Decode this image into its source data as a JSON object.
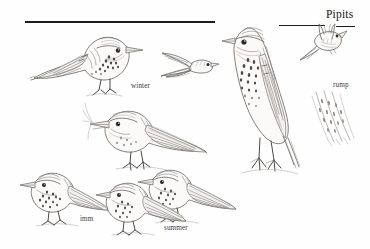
{
  "page": {
    "title": "Pipits",
    "background_color": "#fefefe",
    "ink_color": "#6f6b66",
    "rule_color": "#1c1c1c",
    "width": 370,
    "height": 249,
    "medium": "pencil-and-ink field guide plate"
  },
  "header": {
    "plate_title": "Pipits",
    "rules": [
      {
        "name": "main-rule",
        "x": 25,
        "y": 21,
        "width": 190,
        "thickness": 1.7
      },
      {
        "name": "short-rule",
        "x": 279,
        "y": 25,
        "width": 46,
        "thickness": 1.5
      },
      {
        "name": "title-underline",
        "x": 336,
        "y": 26,
        "width": 19,
        "thickness": 1.5
      }
    ]
  },
  "captions": [
    {
      "name": "winter",
      "label": "winter",
      "x": 131,
      "y": 86
    },
    {
      "name": "rump",
      "label": "rump",
      "x": 333,
      "y": 85
    },
    {
      "name": "imm",
      "label": "imm",
      "x": 80,
      "y": 219
    },
    {
      "name": "summer",
      "label": "summer",
      "x": 164,
      "y": 228
    }
  ],
  "figures": [
    {
      "name": "perched-pipit-winter",
      "kind": "perched-bird",
      "caption": "winter",
      "pose": "perched on ground, facing right",
      "x": 30,
      "y": 26,
      "width": 115,
      "height": 72
    },
    {
      "name": "flying-pipit-small",
      "kind": "flying-bird",
      "pose": "in flight, facing right, wings spread",
      "x": 160,
      "y": 48,
      "width": 58,
      "height": 36
    },
    {
      "name": "standing-pipit-large",
      "kind": "perched-bird",
      "pose": "upright, long legs, facing left",
      "x": 224,
      "y": 12,
      "width": 84,
      "height": 166
    },
    {
      "name": "flying-pipit-upper-right",
      "kind": "flying-bird",
      "pose": "in flight, viewed from below",
      "x": 300,
      "y": 26,
      "width": 52,
      "height": 34
    },
    {
      "name": "rump-feather-detail",
      "kind": "feather-detail",
      "caption": "rump",
      "pose": "close-up of streaked rump feathers",
      "x": 312,
      "y": 92,
      "width": 48,
      "height": 54
    },
    {
      "name": "walking-pipit-middle",
      "kind": "perched-bird",
      "pose": "walking left, bill open",
      "x": 85,
      "y": 100,
      "width": 120,
      "height": 70
    },
    {
      "name": "perched-pipit-imm",
      "kind": "perched-bird",
      "caption": "imm",
      "pose": "standing, facing left",
      "x": 20,
      "y": 168,
      "width": 84,
      "height": 58
    },
    {
      "name": "perched-pipit-front-summer",
      "kind": "perched-bird",
      "caption": "summer",
      "pose": "standing, facing left, foreground",
      "x": 96,
      "y": 180,
      "width": 86,
      "height": 54
    },
    {
      "name": "perched-pipit-rear-summer",
      "kind": "perched-bird",
      "caption": "summer",
      "pose": "standing, facing left, behind",
      "x": 138,
      "y": 166,
      "width": 96,
      "height": 58
    }
  ]
}
